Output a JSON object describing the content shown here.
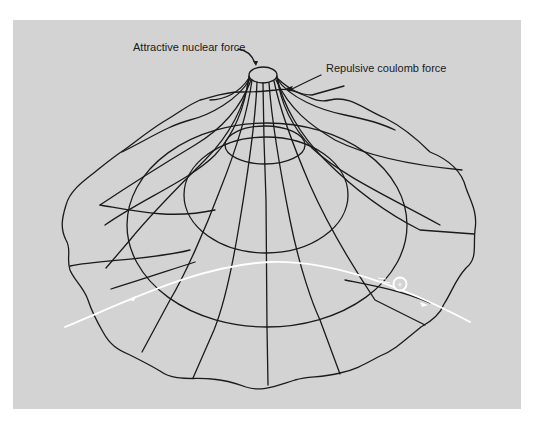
{
  "figure": {
    "labels": {
      "attractive": "Attractive nuclear force",
      "repulsive": "Repulsive coulomb force"
    },
    "particle": {
      "symbol": "+",
      "color": "#ffffff"
    },
    "colors": {
      "background": "#d3d3d3",
      "lines": "#1a1a1a",
      "trajectory": "#ffffff"
    }
  }
}
